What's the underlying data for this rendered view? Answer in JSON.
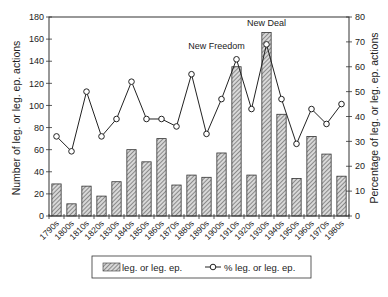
{
  "chart_data": {
    "type": "bar",
    "title": "",
    "xlabel": "",
    "ylabel": "Number of leg. or leg. ep. actions",
    "y2label": "Percentage of leg. or leg. ep. actions",
    "ylim": [
      0,
      180
    ],
    "y2lim": [
      0,
      80
    ],
    "yticks": [
      0,
      20,
      40,
      60,
      80,
      100,
      120,
      140,
      160,
      180
    ],
    "y2ticks": [
      0,
      10,
      20,
      30,
      40,
      50,
      60,
      70,
      80
    ],
    "grid": false,
    "legend_position": "bottom",
    "categories": [
      "1790s",
      "1800s",
      "1810s",
      "1820s",
      "1830s",
      "1840s",
      "1850s",
      "1860s",
      "1870s",
      "1880s",
      "1890s",
      "1900s",
      "1910s",
      "1920s",
      "1930s",
      "1940s",
      "1950s",
      "1960s",
      "1970s",
      "1980s"
    ],
    "series": [
      {
        "name": "leg. or leg. ep.",
        "type": "bar",
        "axis": "left",
        "values": [
          29,
          11,
          27,
          18,
          31,
          60,
          49,
          70,
          28,
          37,
          35,
          57,
          135,
          37,
          166,
          92,
          34,
          72,
          56,
          36
        ]
      },
      {
        "name": "% leg. or leg. ep.",
        "type": "line",
        "axis": "right",
        "values": [
          32,
          26,
          50,
          32,
          39,
          54,
          39,
          39,
          36,
          57,
          33,
          47,
          63,
          43,
          69,
          47,
          29,
          43,
          37,
          45
        ]
      }
    ],
    "annotations": [
      {
        "text": "New Freedom",
        "category": "1910s"
      },
      {
        "text": "New Deal",
        "category": "1930s"
      }
    ]
  }
}
